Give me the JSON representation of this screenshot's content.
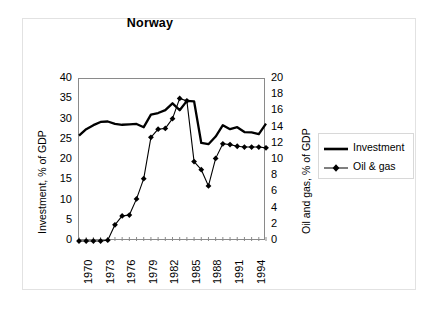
{
  "chart_data": {
    "type": "line",
    "title": "Norway",
    "xlabel": "",
    "ylabel": "Investment, % of GDP",
    "y2label": "Oil and gas, % of GDP",
    "grid": false,
    "legend_position": "right",
    "xlim": [
      1970,
      1996
    ],
    "ylim": [
      0,
      40
    ],
    "y2lim": [
      0,
      20
    ],
    "x": [
      1970,
      1971,
      1972,
      1973,
      1974,
      1975,
      1976,
      1977,
      1978,
      1979,
      1980,
      1981,
      1982,
      1983,
      1984,
      1985,
      1986,
      1987,
      1988,
      1989,
      1990,
      1991,
      1992,
      1993,
      1994,
      1995,
      1996
    ],
    "x_tick_labels": [
      "1970",
      "1973",
      "1976",
      "1979",
      "1982",
      "1985",
      "1988",
      "1991",
      "1994"
    ],
    "x_tick_values": [
      1970,
      1973,
      1976,
      1979,
      1982,
      1985,
      1988,
      1991,
      1994
    ],
    "y_tick_labels": [
      "0",
      "5",
      "10",
      "15",
      "20",
      "25",
      "30",
      "35",
      "40"
    ],
    "y_tick_values": [
      0,
      5,
      10,
      15,
      20,
      25,
      30,
      35,
      40
    ],
    "y2_tick_labels": [
      "0",
      "2",
      "4",
      "6",
      "8",
      "10",
      "12",
      "14",
      "16",
      "18",
      "20"
    ],
    "y2_tick_values": [
      0,
      2,
      4,
      6,
      8,
      10,
      12,
      14,
      16,
      18,
      20
    ],
    "series": [
      {
        "name": "Investment",
        "axis": "left",
        "marker": "none",
        "color": "#000000",
        "values": [
          26.0,
          27.6,
          28.6,
          29.4,
          29.5,
          28.9,
          28.7,
          28.8,
          28.9,
          28.1,
          31.2,
          31.6,
          32.3,
          34.0,
          32.3,
          34.6,
          34.5,
          24.2,
          23.9,
          25.8,
          28.6,
          27.6,
          28.1,
          26.9,
          26.8,
          26.4,
          29.0
        ]
      },
      {
        "name": "Oil & gas",
        "axis": "right",
        "marker": "diamond",
        "color": "#000000",
        "values": [
          0.0,
          0.0,
          0.0,
          0.0,
          0.1,
          2.0,
          3.1,
          3.2,
          5.2,
          7.7,
          12.8,
          13.8,
          13.9,
          15.1,
          17.6,
          17.3,
          9.8,
          8.8,
          6.8,
          10.2,
          12.0,
          11.9,
          11.7,
          11.6,
          11.6,
          11.6,
          11.5
        ]
      }
    ]
  },
  "legend": {
    "items": [
      {
        "label": "Investment",
        "key": "thick-line"
      },
      {
        "label": "Oil & gas",
        "key": "line-with-diamond"
      }
    ]
  }
}
